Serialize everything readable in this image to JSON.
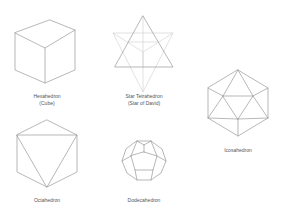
{
  "solids": [
    {
      "id": "hexahedron",
      "label_line1": "Hexahedron",
      "label_line2": "(Cube)"
    },
    {
      "id": "star-tetrahedron",
      "label_line1": "Star Tetrahedron",
      "label_line2": "(Star of David)"
    },
    {
      "id": "icosahedron",
      "label_line1": "Icosahedron",
      "label_line2": ""
    },
    {
      "id": "octahedron",
      "label_line1": "Octahedron",
      "label_line2": ""
    },
    {
      "id": "dodecahedron",
      "label_line1": "Dodecahedron",
      "label_line2": ""
    }
  ],
  "colors": {
    "line": "#9a9a9a",
    "faint_line": "#cfcfcf",
    "text": "#555555",
    "background": "#ffffff"
  }
}
